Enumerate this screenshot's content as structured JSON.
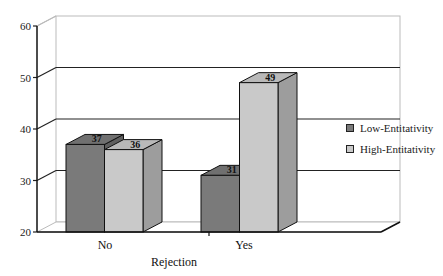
{
  "chart_data": {
    "type": "bar",
    "style": "3d-clustered-column",
    "title": "",
    "xlabel": "Rejection",
    "ylabel": "",
    "categories": [
      "No",
      "Yes"
    ],
    "series": [
      {
        "name": "Low-Entitativity",
        "values": [
          37,
          31
        ],
        "color": "#7a7a7a"
      },
      {
        "name": "High-Entitativity",
        "values": [
          36,
          49
        ],
        "color": "#c9c9c9"
      }
    ],
    "ylim": [
      20,
      60
    ],
    "yticks": [
      20,
      30,
      40,
      50,
      60
    ],
    "grid": true,
    "legend_position": "right",
    "data_labels": true
  },
  "legend": {
    "items": [
      {
        "label": "Low-Entitativity",
        "color": "#7a7a7a"
      },
      {
        "label": "High-Entitativity",
        "color": "#c9c9c9"
      }
    ]
  }
}
